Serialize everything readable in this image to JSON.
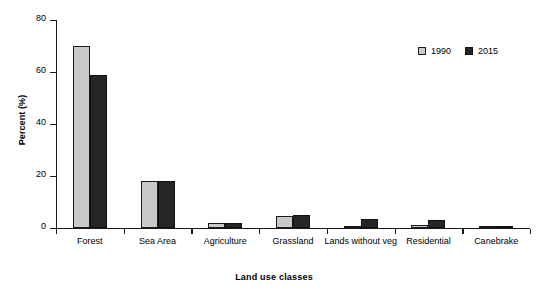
{
  "chart_data": {
    "type": "bar",
    "title": "",
    "xlabel": "Land use classes",
    "ylabel": "Percent (%)",
    "categories": [
      "Forest",
      "Sea Area",
      "Agriculture",
      "Grassland",
      "Lands without veg",
      "Residential",
      "Canebrake"
    ],
    "series": [
      {
        "name": "1990",
        "color": "#c9c9c9",
        "values": [
          70,
          18,
          2,
          4.5,
          0.3,
          1,
          0.3
        ]
      },
      {
        "name": "2015",
        "color": "#262626",
        "values": [
          59,
          18,
          2,
          5,
          3.5,
          3,
          0.3
        ]
      }
    ],
    "ylim": [
      0,
      80
    ],
    "yticks": [
      0,
      20,
      40,
      60,
      80
    ],
    "ytick_labels": [
      "0",
      "20",
      "40",
      "60",
      "80"
    ],
    "grid": false,
    "legend_position": "top-right"
  },
  "legend": {
    "items": [
      {
        "label": "1990"
      },
      {
        "label": "2015"
      }
    ]
  },
  "axes": {
    "y_title": "Percent (%)",
    "x_title": "Land use classes"
  }
}
